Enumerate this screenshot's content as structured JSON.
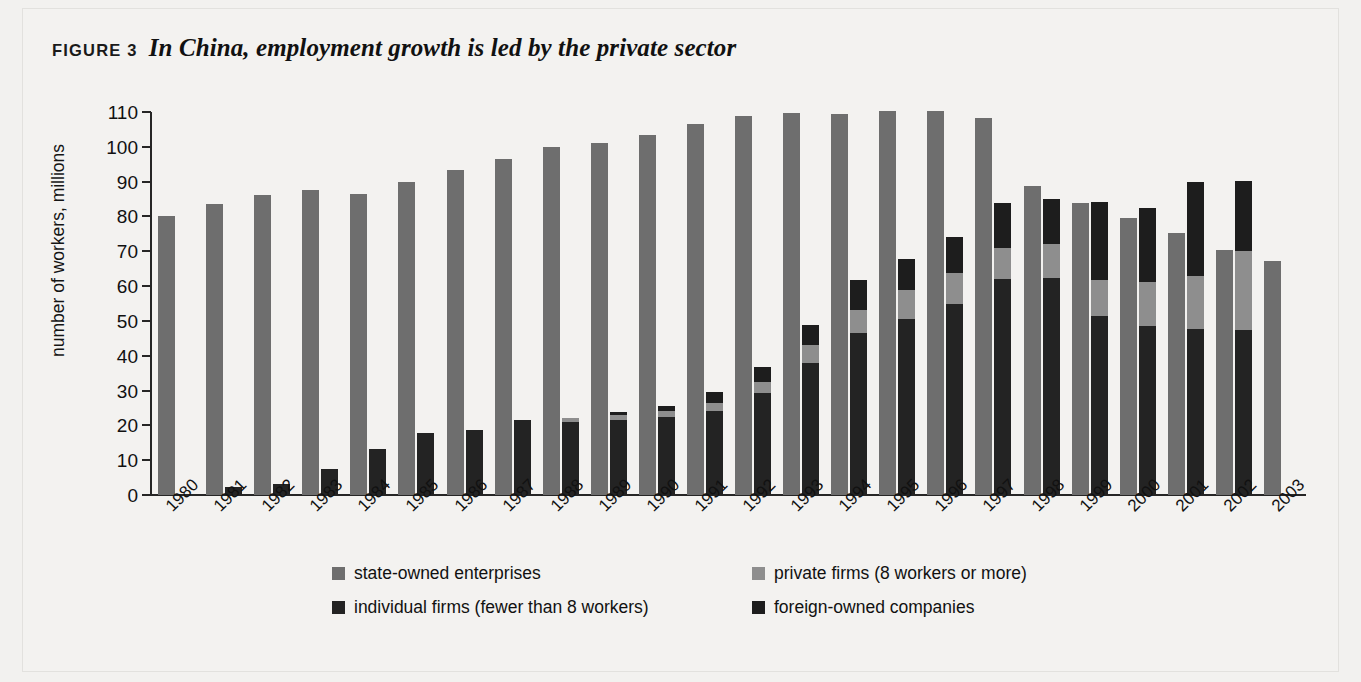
{
  "figure": {
    "label": "FIGURE 3",
    "title": "In China, employment growth is led by the private sector"
  },
  "chart_data": {
    "type": "bar",
    "subtype": "grouped-stacked",
    "title": "In China, employment growth is led by the private sector",
    "xlabel": "",
    "ylabel": "number of workers, millions",
    "ylim": [
      0,
      110
    ],
    "yticks": [
      0,
      10,
      20,
      30,
      40,
      50,
      60,
      70,
      80,
      90,
      100,
      110
    ],
    "grid": false,
    "legend_position": "bottom",
    "categories": [
      "1980",
      "1981",
      "1982",
      "1983",
      "1984",
      "1985",
      "1986",
      "1987",
      "1988",
      "1989",
      "1990",
      "1991",
      "1992",
      "1993",
      "1994",
      "1995",
      "1996",
      "1997",
      "1998",
      "1999",
      "2000",
      "2001",
      "2002",
      "2003"
    ],
    "series": [
      {
        "name": "state-owned enterprises",
        "color": "#6e6e6e",
        "stack": "A",
        "values": [
          80.2,
          83.7,
          86.3,
          87.5,
          86.4,
          89.9,
          93.3,
          96.5,
          100.0,
          101.2,
          103.5,
          106.7,
          108.9,
          109.8,
          109.5,
          110.3,
          110.4,
          108.2,
          88.8,
          83.9,
          79.6,
          75.3,
          70.4,
          67.1
        ]
      },
      {
        "name": "individual firms (fewer than 8 workers)",
        "color": "#232323",
        "stack": "B",
        "values": [
          0.0,
          2.3,
          3.2,
          7.5,
          13.3,
          17.8,
          18.6,
          21.6,
          20.9,
          21.5,
          22.5,
          24.1,
          29.4,
          37.8,
          46.5,
          50.6,
          54.9,
          61.9,
          62.4,
          51.3,
          48.4,
          47.7,
          47.4,
          0.0
        ]
      },
      {
        "name": "private firms (8 workers or more)",
        "color": "#8e8e8e",
        "stack": "B",
        "values": [
          0.0,
          0.0,
          0.0,
          0.0,
          0.0,
          0.0,
          0.0,
          0.0,
          1.2,
          1.5,
          1.7,
          2.2,
          3.0,
          5.2,
          6.5,
          8.3,
          8.8,
          9.1,
          9.6,
          10.5,
          12.7,
          15.3,
          22.7,
          0.0
        ]
      },
      {
        "name": "foreign-owned companies",
        "color": "#1d1d1d",
        "stack": "B",
        "values": [
          0.0,
          0.0,
          0.0,
          0.0,
          0.0,
          0.0,
          0.0,
          0.0,
          0.0,
          0.8,
          1.5,
          3.2,
          4.4,
          5.8,
          8.7,
          9.0,
          10.5,
          13.0,
          12.9,
          22.3,
          21.2,
          27.0,
          20.0,
          0.0
        ]
      }
    ]
  },
  "legend": [
    {
      "label": "state-owned enterprises",
      "swatch": "sw-soe"
    },
    {
      "label": "private firms (8 workers or more)",
      "swatch": "sw-priv"
    },
    {
      "label": "individual firms (fewer than 8 workers)",
      "swatch": "sw-ind"
    },
    {
      "label": "foreign-owned companies",
      "swatch": "sw-for"
    }
  ]
}
